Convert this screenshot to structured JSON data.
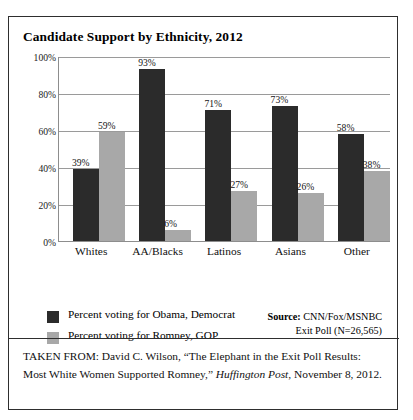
{
  "figure": {
    "title": "Candidate Support by Ethnicity, 2012",
    "caption_line1": "TAKEN FROM: David C. Wilson, “The Elephant in the Exit Poll",
    "caption_line2_a": "Results: Most White Women Supported Romney,” ",
    "caption_line2_italic": "Huffington Post",
    "caption_line2_b": ",",
    "caption_line3": "November 8, 2012."
  },
  "source": {
    "label": "Source:",
    "line1": " CNN/Fox/MSNBC",
    "line2": "Exit Poll (N=26,565)"
  },
  "legend": {
    "items": [
      {
        "label": "Percent voting for Obama, Democrat",
        "color": "#2b2b2b"
      },
      {
        "label": "Percent voting for Romney, GOP",
        "color": "#a8a8a8"
      }
    ]
  },
  "axis": {
    "ticks": [
      "100%",
      "80%",
      "60%",
      "40%",
      "20%",
      "0%"
    ]
  },
  "chart_data": {
    "type": "bar",
    "title": "Candidate Support by Ethnicity, 2012",
    "xlabel": "",
    "ylabel": "",
    "ylim": [
      0,
      100
    ],
    "ytick_values": [
      0,
      20,
      40,
      60,
      80,
      100
    ],
    "ytick_labels": [
      "0%",
      "20%",
      "40%",
      "60%",
      "80%",
      "100%"
    ],
    "grid": "horizontal",
    "legend_position": "below-left",
    "categories": [
      "Whites",
      "AA/Blacks",
      "Latinos",
      "Asians",
      "Other"
    ],
    "series": [
      {
        "name": "Percent voting for Obama, Democrat",
        "color": "#2b2b2b",
        "values": [
          39,
          93,
          71,
          73,
          58
        ],
        "labels": [
          "39%",
          "93%",
          "71%",
          "73%",
          "58%"
        ]
      },
      {
        "name": "Percent voting for Romney, GOP",
        "color": "#a8a8a8",
        "values": [
          59,
          6,
          27,
          26,
          38
        ],
        "labels": [
          "59%",
          "6%",
          "27%",
          "26%",
          "38%"
        ]
      }
    ]
  }
}
